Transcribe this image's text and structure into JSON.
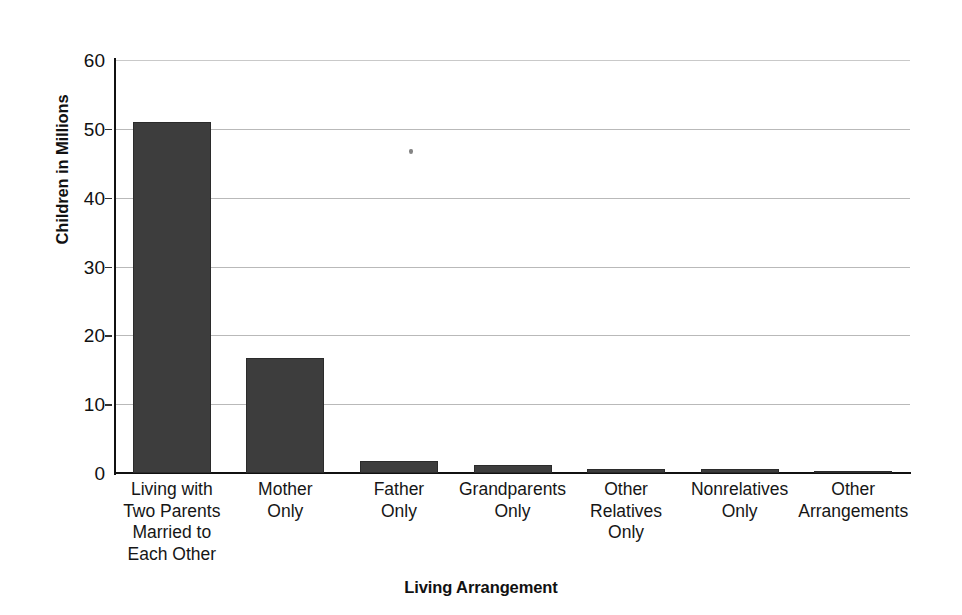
{
  "chart_data": {
    "type": "bar",
    "title": "",
    "xlabel": "Living Arrangement",
    "ylabel": "Children in Millions",
    "ylim": [
      0,
      60
    ],
    "yticks": [
      0,
      10,
      20,
      30,
      40,
      50,
      60
    ],
    "grid": true,
    "legend": "none",
    "bar_color": "#3d3d3d",
    "gridline_color": "#b9b9b9",
    "axis_color": "#111111",
    "categories": [
      "Living with Two Parents Married to Each Other",
      "Mother Only",
      "Father Only",
      "Grandparents Only",
      "Other Relatives Only",
      "Nonrelatives Only",
      "Other Arrangements"
    ],
    "category_lines": [
      [
        "Living with",
        "Two Parents",
        "Married to",
        "Each Other"
      ],
      [
        "Mother",
        "Only"
      ],
      [
        "Father",
        "Only"
      ],
      [
        "Grandparents",
        "Only"
      ],
      [
        "Other",
        "Relatives",
        "Only"
      ],
      [
        "Nonrelatives",
        "Only"
      ],
      [
        "Other",
        "Arrangements"
      ]
    ],
    "values": [
      51.0,
      16.7,
      1.8,
      1.2,
      0.65,
      0.55,
      0.15
    ]
  }
}
